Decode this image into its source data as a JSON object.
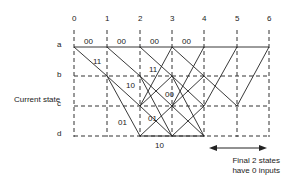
{
  "diagram": {
    "type": "trellis",
    "time_steps": [
      "0",
      "1",
      "2",
      "3",
      "4",
      "5",
      "6"
    ],
    "states": [
      "a",
      "b",
      "c",
      "d"
    ],
    "axis_label": "Current state",
    "edge_labels": [
      {
        "text": "00",
        "pos": "a 0-1"
      },
      {
        "text": "00",
        "pos": "a 1-2"
      },
      {
        "text": "00",
        "pos": "a 2-3"
      },
      {
        "text": "00",
        "pos": "a 3-4"
      },
      {
        "text": "11",
        "pos": "a0-b1"
      },
      {
        "text": "11",
        "pos": "a2-b3"
      },
      {
        "text": "10",
        "pos": "b1-c2"
      },
      {
        "text": "00",
        "pos": "c2-c3 region"
      },
      {
        "text": "01",
        "pos": "b1-d2"
      },
      {
        "text": "01",
        "pos": "c2-d3 region"
      },
      {
        "text": "10",
        "pos": "below d 2-3"
      }
    ],
    "annotation": {
      "line1": "Final 2 states",
      "line2": "have 0 inputs"
    }
  }
}
